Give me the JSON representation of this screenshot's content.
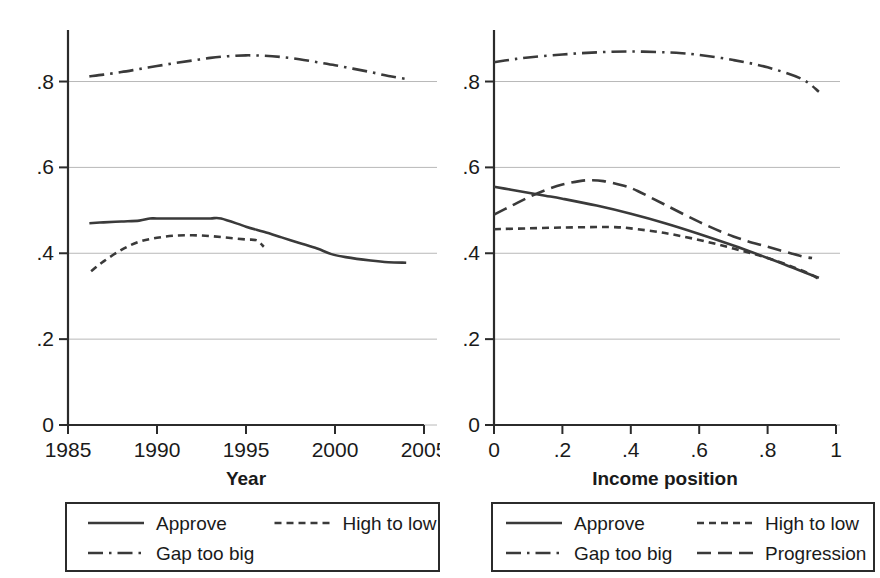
{
  "chart_data": [
    {
      "panel": "left",
      "type": "line",
      "title": "",
      "xlabel": "Year",
      "ylabel": "",
      "xlim": [
        1985,
        2005
      ],
      "ylim": [
        0,
        0.92
      ],
      "xticks": [
        1985,
        1990,
        1995,
        2000,
        2005
      ],
      "xticklabels": [
        "1985",
        "1990",
        "1995",
        "2000",
        "2005"
      ],
      "yticks": [
        0,
        0.2,
        0.4,
        0.6,
        0.8
      ],
      "yticklabels": [
        "0",
        ".2",
        ".4",
        ".6",
        ".8"
      ],
      "grid": "horizontal",
      "legend_position": "below",
      "series": [
        {
          "name": "Approve",
          "style": "solid",
          "x": [
            1986.2,
            1987,
            1988,
            1989,
            1989.6,
            1990,
            1991,
            1992,
            1993,
            1993.6,
            1995,
            1996,
            1997,
            1998,
            1999,
            1999.8,
            2000.6,
            2002,
            2003,
            2004
          ],
          "values": [
            0.47,
            0.472,
            0.474,
            0.476,
            0.481,
            0.481,
            0.481,
            0.481,
            0.481,
            0.481,
            0.462,
            0.45,
            0.437,
            0.424,
            0.411,
            0.398,
            0.391,
            0.383,
            0.379,
            0.378
          ]
        },
        {
          "name": "High to low",
          "style": "dotted",
          "x": [
            1986.3,
            1987,
            1988,
            1989,
            1990,
            1991,
            1992,
            1993,
            1994,
            1995,
            1995.6,
            1996
          ],
          "values": [
            0.358,
            0.381,
            0.408,
            0.427,
            0.436,
            0.441,
            0.442,
            0.44,
            0.436,
            0.432,
            0.43,
            0.415
          ]
        },
        {
          "name": "Gap too big",
          "style": "dashdot",
          "x": [
            1986.2,
            1987,
            1988,
            1989,
            1990,
            1991,
            1992,
            1993,
            1994,
            1995,
            1996,
            1997,
            1998,
            1999,
            2000,
            2001,
            2002,
            2003,
            2004
          ],
          "values": [
            0.812,
            0.816,
            0.822,
            0.829,
            0.836,
            0.843,
            0.849,
            0.855,
            0.859,
            0.861,
            0.86,
            0.857,
            0.852,
            0.845,
            0.838,
            0.83,
            0.822,
            0.813,
            0.806
          ]
        }
      ]
    },
    {
      "panel": "right",
      "type": "line",
      "title": "",
      "xlabel": "Income position",
      "ylabel": "",
      "xlim": [
        0,
        1
      ],
      "ylim": [
        0,
        0.92
      ],
      "xticks": [
        0,
        0.2,
        0.4,
        0.6,
        0.8,
        1
      ],
      "xticklabels": [
        "0",
        ".2",
        ".4",
        ".6",
        ".8",
        "1"
      ],
      "yticks": [
        0,
        0.2,
        0.4,
        0.6,
        0.8
      ],
      "yticklabels": [
        "0",
        ".2",
        ".4",
        ".6",
        ".8"
      ],
      "grid": "horizontal",
      "legend_position": "below",
      "series": [
        {
          "name": "Approve",
          "style": "solid",
          "x": [
            0.0,
            0.05,
            0.1,
            0.15,
            0.2,
            0.3,
            0.4,
            0.5,
            0.6,
            0.7,
            0.8,
            0.85,
            0.9,
            0.95
          ],
          "values": [
            0.555,
            0.548,
            0.541,
            0.534,
            0.527,
            0.511,
            0.492,
            0.47,
            0.445,
            0.418,
            0.389,
            0.374,
            0.358,
            0.343
          ]
        },
        {
          "name": "High to low",
          "style": "dotted",
          "x": [
            0.0,
            0.1,
            0.2,
            0.3,
            0.35,
            0.4,
            0.5,
            0.6,
            0.7,
            0.8,
            0.9,
            0.95
          ],
          "values": [
            0.456,
            0.458,
            0.46,
            0.461,
            0.461,
            0.458,
            0.447,
            0.431,
            0.411,
            0.389,
            0.36,
            0.34
          ]
        },
        {
          "name": "Gap too big",
          "style": "dashdot",
          "x": [
            0.0,
            0.05,
            0.1,
            0.2,
            0.3,
            0.4,
            0.5,
            0.55,
            0.6,
            0.7,
            0.8,
            0.9,
            0.95
          ],
          "values": [
            0.845,
            0.851,
            0.856,
            0.863,
            0.868,
            0.87,
            0.868,
            0.866,
            0.862,
            0.85,
            0.833,
            0.806,
            0.776
          ]
        },
        {
          "name": "Progression",
          "style": "dashed",
          "x": [
            0.0,
            0.05,
            0.1,
            0.15,
            0.2,
            0.25,
            0.28,
            0.32,
            0.38,
            0.42,
            0.5,
            0.6,
            0.7,
            0.8,
            0.9,
            0.93
          ],
          "values": [
            0.49,
            0.51,
            0.53,
            0.547,
            0.56,
            0.568,
            0.57,
            0.568,
            0.557,
            0.545,
            0.513,
            0.473,
            0.439,
            0.415,
            0.393,
            0.389
          ]
        }
      ]
    }
  ],
  "panels": {
    "left": {
      "xlabel": "Year",
      "xticklabels": [
        "1985",
        "1990",
        "1995",
        "2000",
        "2005"
      ],
      "yticklabels": [
        "0",
        ".2",
        ".4",
        ".6",
        ".8"
      ],
      "legend": [
        {
          "label": "Approve",
          "style": "solid"
        },
        {
          "label": "High to low",
          "style": "dotted"
        },
        {
          "label": "Gap too big",
          "style": "dashdot"
        }
      ]
    },
    "right": {
      "xlabel": "Income position",
      "xticklabels": [
        "0",
        ".2",
        ".4",
        ".6",
        ".8",
        "1"
      ],
      "yticklabels": [
        "0",
        ".2",
        ".4",
        ".6",
        ".8"
      ],
      "legend": [
        {
          "label": "Approve",
          "style": "solid"
        },
        {
          "label": "High to low",
          "style": "dotted"
        },
        {
          "label": "Gap too big",
          "style": "dashdot"
        },
        {
          "label": "Progression",
          "style": "dashed"
        }
      ]
    }
  },
  "colors": {
    "line": "#3a3a3a",
    "axis": "#2b2b2b",
    "grid": "#b8b8b8",
    "background": "#ffffff"
  }
}
